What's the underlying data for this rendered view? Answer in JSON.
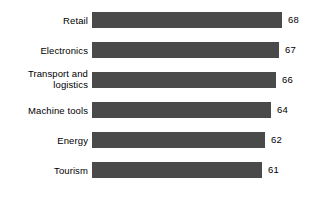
{
  "chart_data": {
    "type": "bar",
    "orientation": "horizontal",
    "title": "",
    "subtitle": "",
    "xlabel": "",
    "ylabel": "",
    "categories": [
      "Retail",
      "Electronics",
      "Transport and\nlogistics",
      "Machine tools",
      "Energy",
      "Tourism"
    ],
    "values": [
      68,
      67,
      66,
      64,
      62,
      61
    ],
    "value_labels": [
      "68",
      "67",
      "66",
      "64",
      "62",
      "61"
    ],
    "xlim": [
      0,
      72
    ],
    "grid": false,
    "legend": false,
    "axis_visible": false,
    "bar_color": "#4a4a4a",
    "background_color": "#ffffff",
    "label_color": "#000000"
  }
}
